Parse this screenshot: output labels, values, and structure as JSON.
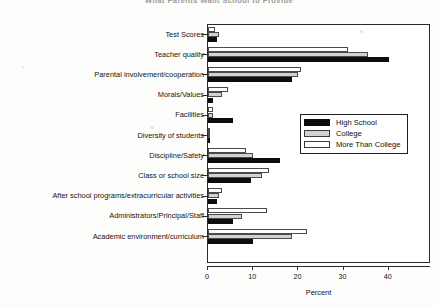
{
  "chart_data": {
    "type": "bar",
    "orientation": "horizontal",
    "title": "What Parents Want School to Provide",
    "xlabel": "Percent",
    "ylabel": "",
    "xlim": [
      0,
      44
    ],
    "xticks": [
      0,
      10,
      20,
      30,
      40
    ],
    "xtick_labels": [
      "0",
      "10",
      "20",
      "30",
      "40"
    ],
    "grid": false,
    "legend_position": "right-upper",
    "categories": [
      "Test Scores",
      "Teacher quality",
      "Parental involvement/cooperation",
      "Morals/Values",
      "Facilities",
      "Diversity of students",
      "Discipline/Safety",
      "Class or school size",
      "After school programs/extracurricular activities",
      "Administrators/Principal/Staff",
      "Academic environment/curriculum"
    ],
    "series": [
      {
        "name": "High School",
        "color": "#0d0d0d",
        "values": [
          2.0,
          40.0,
          18.5,
          1.0,
          5.5,
          0.5,
          16.0,
          9.5,
          2.0,
          5.5,
          10.0
        ]
      },
      {
        "name": "College",
        "color": "#d2d2d2",
        "values": [
          2.5,
          35.5,
          20.0,
          3.0,
          1.0,
          0.5,
          10.0,
          12.0,
          2.5,
          7.5,
          18.5
        ]
      },
      {
        "name": "More Than College",
        "color": "#ffffff",
        "values": [
          1.5,
          31.0,
          20.5,
          4.5,
          1.0,
          0.5,
          8.5,
          13.5,
          3.0,
          13.0,
          22.0
        ]
      }
    ]
  },
  "legend": {
    "entries": [
      {
        "label": "High School",
        "swatch": "hs"
      },
      {
        "label": "College",
        "swatch": "col"
      },
      {
        "label": "More Than College",
        "swatch": "mtc"
      }
    ]
  }
}
